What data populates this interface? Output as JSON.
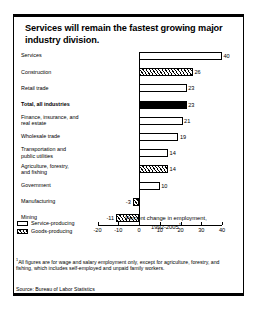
{
  "figure": {
    "title": "Services will remain the fastest growing major industry division.",
    "axis_title_line1": "Percent change in employment,",
    "axis_title_line2": "1992-2005",
    "axis_title_marker": "1",
    "footnote_marker": "1",
    "footnote": "All figures are for wage and salary employment only, except for agriculture, forestry, and fishing, which includes self-employed and unpaid family workers.",
    "source": "Source: Bureau of Labor Statistics",
    "legend": [
      {
        "label": "Service-producing",
        "pattern": "open"
      },
      {
        "label": "Goods-producing",
        "pattern": "hatched"
      }
    ]
  },
  "chart_data": {
    "type": "bar",
    "orientation": "horizontal",
    "title": "Services will remain the fastest growing major industry division.",
    "xlabel": "Percent change in employment, 1992-2005",
    "ylabel": "",
    "xlim": [
      -20,
      40
    ],
    "xticks": [
      -20,
      -10,
      0,
      10,
      20,
      30,
      40
    ],
    "xtick_labels": [
      "-20",
      "-10",
      "0",
      "10",
      "20",
      "30",
      "40"
    ],
    "grid": false,
    "legend_position": "bottom-left",
    "categories": [
      "Services",
      "Construction",
      "Retail trade",
      "Total, all industries",
      "Finance, insurance, and real estate",
      "Wholesale trade",
      "Transportation and public utilities",
      "Agriculture, forestry, and fishing",
      "Government",
      "Manufacturing",
      "Mining"
    ],
    "values": [
      40,
      26,
      23,
      23,
      21,
      19,
      14,
      14,
      10,
      -3,
      -11
    ],
    "value_labels": [
      "40",
      "26",
      "23",
      "23",
      "21",
      "19",
      "14",
      "14",
      "10",
      "-3",
      "-11"
    ],
    "patterns": [
      "open",
      "hatched",
      "open",
      "solid",
      "open",
      "open",
      "open",
      "hatched",
      "open",
      "hatched",
      "hatched"
    ],
    "bars": [
      {
        "label": "Services",
        "label_lines": [
          "Services"
        ],
        "value": 40,
        "value_label": "40",
        "pattern": "open"
      },
      {
        "label": "Construction",
        "label_lines": [
          "Construction"
        ],
        "value": 26,
        "value_label": "26",
        "pattern": "hatched"
      },
      {
        "label": "Retail trade",
        "label_lines": [
          "Retail trade"
        ],
        "value": 23,
        "value_label": "23",
        "pattern": "open"
      },
      {
        "label": "Total, all industries",
        "label_lines": [
          "Total, all industries"
        ],
        "value": 23,
        "value_label": "23",
        "pattern": "solid"
      },
      {
        "label": "Finance, insurance, and real estate",
        "label_lines": [
          "Finance, insurance, and",
          "real estate"
        ],
        "value": 21,
        "value_label": "21",
        "pattern": "open"
      },
      {
        "label": "Wholesale trade",
        "label_lines": [
          "Wholesale trade"
        ],
        "value": 19,
        "value_label": "19",
        "pattern": "open"
      },
      {
        "label": "Transportation and public utilities",
        "label_lines": [
          "Transportation and",
          "public utilities"
        ],
        "value": 14,
        "value_label": "14",
        "pattern": "open"
      },
      {
        "label": "Agriculture, forestry, and fishing",
        "label_lines": [
          "Agriculture, forestry,",
          "and fishing"
        ],
        "value": 14,
        "value_label": "14",
        "pattern": "hatched"
      },
      {
        "label": "Government",
        "label_lines": [
          "Government"
        ],
        "value": 10,
        "value_label": "10",
        "pattern": "open"
      },
      {
        "label": "Manufacturing",
        "label_lines": [
          "Manufacturing"
        ],
        "value": -3,
        "value_label": "-3",
        "pattern": "hatched"
      },
      {
        "label": "Mining",
        "label_lines": [
          "Mining"
        ],
        "value": -11,
        "value_label": "-11",
        "pattern": "hatched"
      }
    ]
  }
}
